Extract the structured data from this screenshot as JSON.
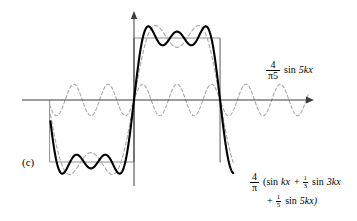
{
  "figure": {
    "panel_label": "(c)",
    "caption_kind": "fourier-square-wave-partial-sum"
  },
  "annotations": {
    "harmonic": {
      "numerator": "4",
      "denominator": "π5",
      "body_fn": "sin",
      "body_arg": "5kx",
      "full_text": "4/π5 sin 5kx"
    },
    "sum": {
      "numerator": "4",
      "denominator": "π",
      "line1_open": "(sin",
      "line1_term1_arg": "kx",
      "line1_plus": "+",
      "line1_frac_num": "1",
      "line1_frac_den": "3",
      "line1_fn": "sin",
      "line1_term2_arg": "3kx",
      "line2_plus": "+",
      "line2_frac_num": "1",
      "line2_frac_den": "5",
      "line2_fn": "sin",
      "line2_term_arg": "5kx)",
      "full_text": "4/π (sin kx + 1/3 sin 3kx + 1/5 sin 5kx)"
    }
  },
  "colors": {
    "axis": "#3d3d3d",
    "square_wave": "#8f8f8f",
    "harmonic": "#a8a8a8",
    "partial_sum": "#000000",
    "background": "#ffffff"
  },
  "chart_data": {
    "type": "line",
    "title": "",
    "subtitle": "",
    "xlabel": "",
    "ylabel": "",
    "grid": false,
    "legend_position": "inline-annotations",
    "axes": {
      "x_axis_pixel_y": 100,
      "y_axis_pixel_x": 134,
      "x_axis_arrow_end_px": 312,
      "y_axis_arrow_top_px": 13,
      "xlim_rad": [
        -3.14159,
        4.2
      ],
      "ylim": [
        -1.45,
        1.45
      ],
      "x_pixels_per_rad": 27.4,
      "y_pixels_per_unit": 62
    },
    "series": [
      {
        "name": "square wave (target)",
        "style": "solid-thin-gray",
        "color": "#8f8f8f",
        "description": "Ideal square wave of amplitude 1, period 2π, drawn as rectangular steps",
        "breakpoints_rad": [
          -3.14159,
          0.0,
          3.14159
        ],
        "level_sequence": [
          -1,
          1,
          -1
        ]
      },
      {
        "name": "4/(5π) sin 5kx",
        "style": "dashed-light-gray",
        "color": "#a8a8a8",
        "amplitude": 0.2546,
        "harmonic": 5,
        "description": "Fifth harmonic component, amplitude 4/(5π) ≈ 0.2546, five oscillations per π of x"
      },
      {
        "name": "4/π (sin kx + 1/3 sin 3kx)",
        "style": "dashed-gray",
        "color": "#a8a8a8",
        "terms": [
          {
            "harmonic": 1,
            "amplitude": 1.2732
          },
          {
            "harmonic": 3,
            "amplitude": 0.4244
          }
        ],
        "description": "Two-term partial sum shown faintly for comparison"
      },
      {
        "name": "4/π (sin kx + 1/3 sin 3kx + 1/5 sin 5kx)",
        "style": "solid-bold-black",
        "color": "#000000",
        "terms": [
          {
            "harmonic": 1,
            "amplitude": 1.2732
          },
          {
            "harmonic": 3,
            "amplitude": 0.4244
          },
          {
            "harmonic": 5,
            "amplitude": 0.2546
          }
        ],
        "peak_value": 1.1,
        "description": "Three-term Fourier partial sum of the square wave, showing ripple and overshoot"
      }
    ]
  }
}
